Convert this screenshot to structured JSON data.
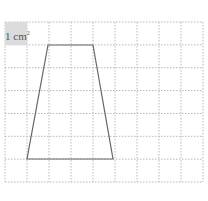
{
  "diagram": {
    "unit_label": "1 cm",
    "unit_exponent": "2",
    "grid": {
      "columns": 9,
      "rows": 7,
      "left": 5,
      "top": 22,
      "cell_width": 22,
      "cell_height": 22.86,
      "line_color": "#b8b8b8"
    },
    "shape": {
      "type": "trapezoid",
      "vertices": [
        [
          48,
          45
        ],
        [
          93,
          45
        ],
        [
          113,
          159
        ],
        [
          27,
          159
        ]
      ],
      "stroke": "#666666"
    }
  }
}
